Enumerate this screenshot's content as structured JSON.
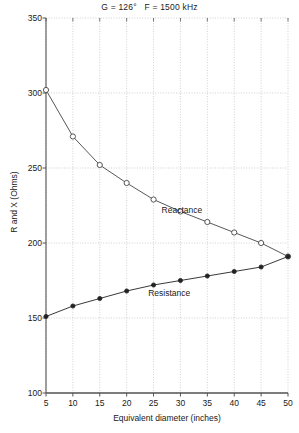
{
  "chart_data": {
    "type": "line",
    "title": "G = 126°   F = 1500 kHz",
    "xlabel": "Equivalent diameter (inches)",
    "ylabel": "R and X (Ohms)",
    "xlim": [
      5,
      50
    ],
    "ylim": [
      100,
      350
    ],
    "xticks": [
      5,
      10,
      15,
      20,
      25,
      30,
      35,
      40,
      45,
      50
    ],
    "yticks": [
      100,
      150,
      200,
      250,
      300,
      350
    ],
    "grid": true,
    "legend_position": "inline-annotations",
    "x": [
      5,
      10,
      15,
      20,
      25,
      30,
      35,
      40,
      45,
      50
    ],
    "series": [
      {
        "name": "Reactance",
        "marker": "open-circle",
        "color": "#444444",
        "values": [
          302,
          271,
          252,
          240,
          229,
          221,
          214,
          207,
          200,
          191
        ]
      },
      {
        "name": "Resistance",
        "marker": "filled-circle",
        "color": "#222222",
        "values": [
          151,
          158,
          163,
          168,
          172,
          175,
          178,
          181,
          184,
          191
        ]
      }
    ],
    "annotations": [
      {
        "text": "Reactance",
        "x": 26.5,
        "y": 222
      },
      {
        "text": "Resistance",
        "x": 24.0,
        "y": 167
      }
    ]
  },
  "axis": {
    "ytick_labels": [
      "350",
      "300",
      "250",
      "200",
      "150",
      "100"
    ],
    "xtick_labels": [
      "5",
      "10",
      "15",
      "20",
      "25",
      "30",
      "35",
      "40",
      "45",
      "50"
    ]
  },
  "colors": {
    "grid": "#bbbbbb",
    "axis": "#555555",
    "series_reactance": "#444444",
    "series_resistance": "#222222",
    "text": "#1a1a1a",
    "background": "#ffffff"
  }
}
